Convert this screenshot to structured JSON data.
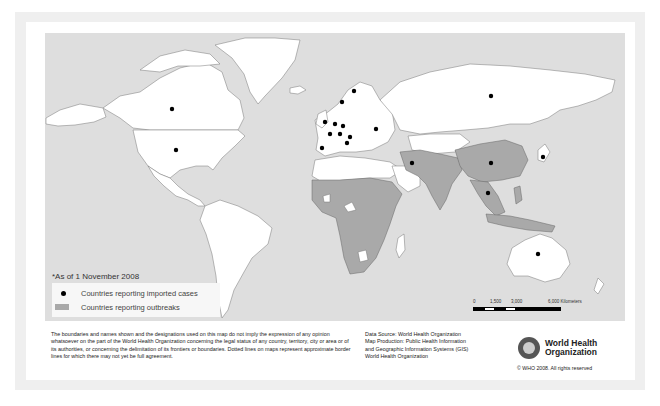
{
  "legend": {
    "date_note": "*As of 1 November 2008",
    "items": [
      {
        "symbol": "black-dot",
        "label": "Countries reporting imported cases"
      },
      {
        "symbol": "gray-swatch",
        "label": "Countries reporting outbreaks"
      }
    ]
  },
  "colors": {
    "ocean": "#dedede",
    "land": "#ffffff",
    "outbreak": "#a9a9a9",
    "imported_case_dot": "#000000",
    "frame": "#efefef"
  },
  "scale_bar": {
    "labels": [
      "0",
      "1,500",
      "3,000",
      "6,000 Kilometers"
    ]
  },
  "map": {
    "imported_case_markers": [
      {
        "region": "Canada",
        "x": 172,
        "y": 109
      },
      {
        "region": "United States",
        "x": 176,
        "y": 150
      },
      {
        "region": "Norway",
        "x": 342,
        "y": 102
      },
      {
        "region": "Sweden",
        "x": 354,
        "y": 91
      },
      {
        "region": "United Kingdom",
        "x": 325,
        "y": 122
      },
      {
        "region": "Netherlands",
        "x": 335,
        "y": 124
      },
      {
        "region": "Germany",
        "x": 343,
        "y": 126
      },
      {
        "region": "France",
        "x": 330,
        "y": 134
      },
      {
        "region": "Switzerland",
        "x": 340,
        "y": 134
      },
      {
        "region": "Austria",
        "x": 350,
        "y": 137
      },
      {
        "region": "Italy",
        "x": 347,
        "y": 143
      },
      {
        "region": "Spain",
        "x": 322,
        "y": 148
      },
      {
        "region": "Ukraine",
        "x": 376,
        "y": 129
      },
      {
        "region": "Russia",
        "x": 491,
        "y": 96
      },
      {
        "region": "Iran",
        "x": 412,
        "y": 163
      },
      {
        "region": "China",
        "x": 491,
        "y": 163
      },
      {
        "region": "Japan",
        "x": 543,
        "y": 157
      },
      {
        "region": "Thailand",
        "x": 488,
        "y": 193
      },
      {
        "region": "Australia",
        "x": 538,
        "y": 254
      }
    ]
  },
  "footer": {
    "disclaimer": "The boundaries and names shown and the designations used on this map do not imply the expression of any opinion whatsoever on the part of the World Health Organization concerning the legal status of any country, territory, city or area or of its authorities, or concerning the delimitation of its frontiers or boundaries. Dotted lines on maps represent approximate border lines for which there may not yet be full agreement.",
    "source_lines": [
      "Data Source: World Health Organization",
      "Map Production: Public Health Information",
      "and Geographic Information Systems (GIS)",
      "World Health Organization"
    ],
    "organization_name_line1": "World Health",
    "organization_name_line2": "Organization",
    "copyright": "© WHO 2008. All rights reserved"
  }
}
